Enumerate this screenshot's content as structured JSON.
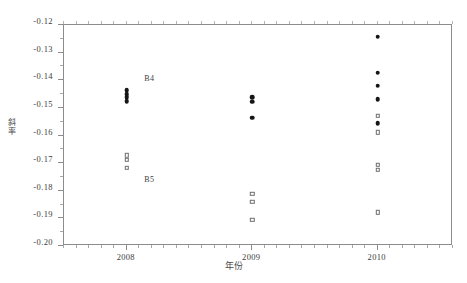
{
  "chart_data": {
    "type": "scatter",
    "title": "",
    "xlabel": "年份",
    "ylabel": "斜率",
    "xlim": [
      2007.5,
      2010.6
    ],
    "ylim": [
      -0.2,
      -0.12
    ],
    "grid": false,
    "legend_position": "none",
    "x_tick_labels": [
      "2008",
      "2009",
      "2010"
    ],
    "x_tick_values": [
      2008,
      2009,
      2010
    ],
    "y_tick_labels": [
      "-0.12",
      "-0.13",
      "-0.14",
      "-0.15",
      "-0.16",
      "-0.17",
      "-0.18",
      "-0.19",
      "-0.20"
    ],
    "y_tick_values": [
      -0.12,
      -0.13,
      -0.14,
      -0.15,
      -0.16,
      -0.17,
      -0.18,
      -0.19,
      -0.2
    ],
    "series": [
      {
        "name": "B4",
        "marker": "filled-circle",
        "color": "#161616",
        "points": [
          {
            "x": 2008,
            "y": -0.1435
          },
          {
            "x": 2008,
            "y": -0.145
          },
          {
            "x": 2008,
            "y": -0.1462
          },
          {
            "x": 2008,
            "y": -0.1475
          },
          {
            "x": 2009,
            "y": -0.1462
          },
          {
            "x": 2009,
            "y": -0.1478
          },
          {
            "x": 2009,
            "y": -0.1535
          },
          {
            "x": 2010,
            "y": -0.1243
          },
          {
            "x": 2010,
            "y": -0.1372
          },
          {
            "x": 2010,
            "y": -0.142
          },
          {
            "x": 2010,
            "y": -0.1468
          },
          {
            "x": 2010,
            "y": -0.1555
          }
        ]
      },
      {
        "name": "B5",
        "marker": "open-square",
        "color": "#6e6e6e",
        "points": [
          {
            "x": 2008,
            "y": -0.1672
          },
          {
            "x": 2008,
            "y": -0.1688
          },
          {
            "x": 2008,
            "y": -0.1718
          },
          {
            "x": 2009,
            "y": -0.181
          },
          {
            "x": 2009,
            "y": -0.184
          },
          {
            "x": 2009,
            "y": -0.1905
          },
          {
            "x": 2010,
            "y": -0.1528
          },
          {
            "x": 2010,
            "y": -0.1588
          },
          {
            "x": 2010,
            "y": -0.1705
          },
          {
            "x": 2010,
            "y": -0.1725
          },
          {
            "x": 2010,
            "y": -0.1878
          }
        ]
      }
    ],
    "annotations": [
      {
        "label": "B4",
        "x": 2008.18,
        "y": -0.1395
      },
      {
        "label": "B5",
        "x": 2008.18,
        "y": -0.1762
      }
    ]
  }
}
